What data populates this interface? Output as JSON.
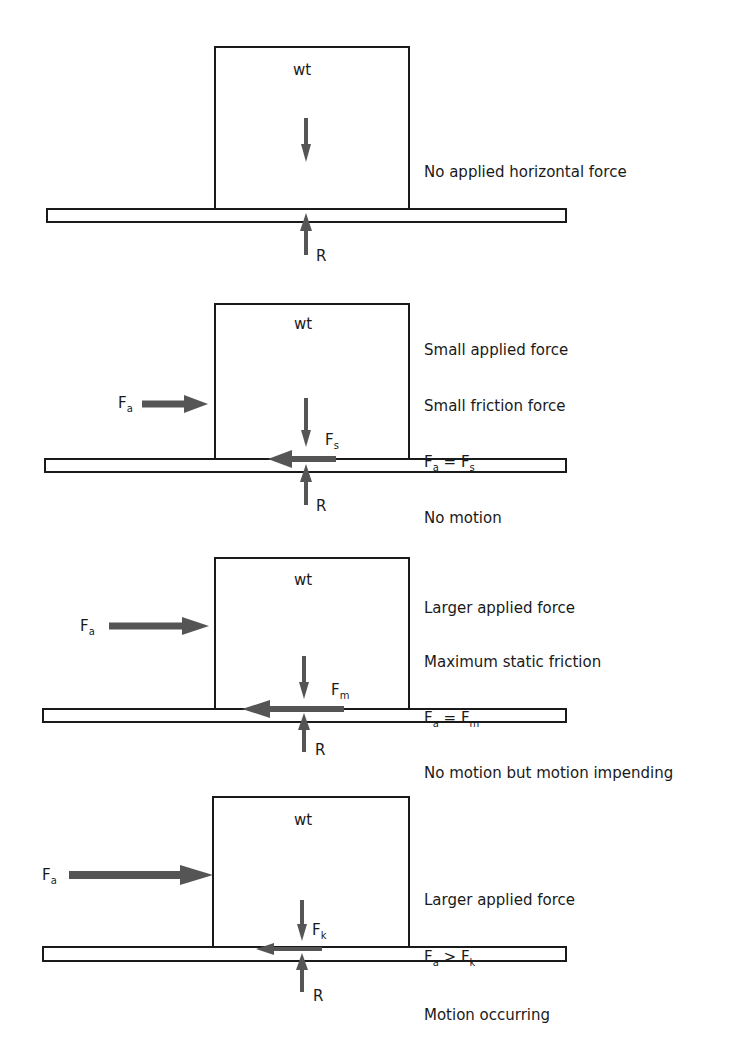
{
  "figure": {
    "colors": {
      "outline": "#1a1a1a",
      "arrow": "#555555",
      "background": "#ffffff"
    },
    "panels": [
      {
        "weight_label": "wt",
        "reaction_label": "R",
        "applied_label": "",
        "applied_sub": "",
        "friction_label": "",
        "friction_sub": "",
        "notes": [
          "No applied horizontal force",
          "No friction",
          "No motion"
        ]
      },
      {
        "weight_label": "wt",
        "reaction_label": "R",
        "applied_label": "F",
        "applied_sub": "a",
        "friction_label": "F",
        "friction_sub": "s",
        "notes": [
          "Small applied force",
          "Small friction force",
          "F_a = F_s",
          "No motion"
        ],
        "equation": {
          "left": "F",
          "left_sub": "a",
          "op": " = ",
          "right": "F",
          "right_sub": "s"
        }
      },
      {
        "weight_label": "wt",
        "reaction_label": "R",
        "applied_label": "F",
        "applied_sub": "a",
        "friction_label": "F",
        "friction_sub": "m",
        "notes": [
          "Larger applied force",
          "Maximum static friction",
          "F_a = F_m",
          "No motion but motion impending"
        ],
        "equation": {
          "left": "F",
          "left_sub": "a",
          "op": " = ",
          "right": "F",
          "right_sub": "m"
        }
      },
      {
        "weight_label": "wt",
        "reaction_label": "R",
        "applied_label": "F",
        "applied_sub": "a",
        "friction_label": "F",
        "friction_sub": "k",
        "notes": [
          "Larger applied force",
          "F_a > F_k",
          "Motion occurring"
        ],
        "equation": {
          "left": "F",
          "left_sub": "a",
          "op": " > ",
          "right": "F",
          "right_sub": "k"
        }
      }
    ]
  }
}
